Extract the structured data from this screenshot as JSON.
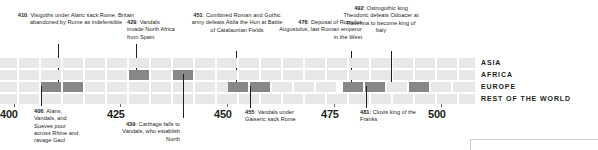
{
  "figure": {
    "kind": "historical-timeline",
    "range_start": 400,
    "range_end": 500
  },
  "axis": {
    "years": [
      {
        "label": "400",
        "value": 400
      },
      {
        "label": "425",
        "value": 425
      },
      {
        "label": "450",
        "value": 450
      },
      {
        "label": "475",
        "value": 475
      },
      {
        "label": "500",
        "value": 500
      }
    ]
  },
  "regions": [
    {
      "label": "ASIA"
    },
    {
      "label": "AFRICA"
    },
    {
      "label": "EUROPE"
    },
    {
      "label": "REST OF THE WORLD"
    }
  ],
  "events": [
    {
      "year": "410",
      "text": "Visigoths under Alaric sack Rome. Britain abandoned by Rome as indefensible",
      "position": "above",
      "region": "EUROPE"
    },
    {
      "year": "429",
      "text": "Vandals invade North Africa from Spain",
      "position": "above",
      "region": "AFRICA"
    },
    {
      "year": "451",
      "text": "Combined Roman and Gothic army defeats Attila the Hun at Battle of Catalaunian Fields",
      "position": "above",
      "region": "EUROPE"
    },
    {
      "year": "476",
      "text": "Deposal of Romulus Augustulus, last Roman emperor in the West",
      "position": "above",
      "region": "EUROPE"
    },
    {
      "year": "492",
      "text": "Ostrogothic king Theodoric defeats Odoacer at Ravenna to become king of Italy",
      "position": "above",
      "region": "EUROPE"
    },
    {
      "year": "406",
      "text": "Alans, Vandals, and Sueves pour across Rhine and ravage Gaul",
      "position": "below",
      "region": "EUROPE"
    },
    {
      "year": "439",
      "text": "Carthage falls to Vandals, who establish North",
      "position": "below",
      "region": "AFRICA"
    },
    {
      "year": "455",
      "text": "Vandals under Gaiseric sack Rome",
      "position": "below",
      "region": "EUROPE"
    },
    {
      "year": "481",
      "text": "Clovis king of the Franks",
      "position": "below",
      "region": "EUROPE"
    }
  ],
  "colors": {
    "cell_empty": "#e7e7e7",
    "cell_filled": "#878787",
    "text": "#231f20",
    "background": "#ffffff"
  }
}
